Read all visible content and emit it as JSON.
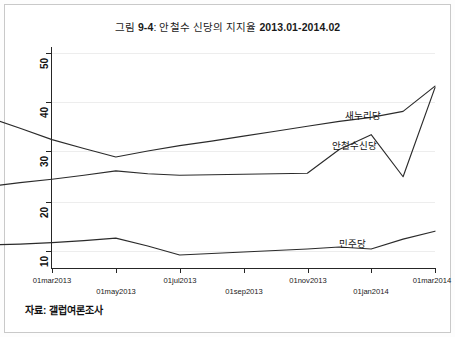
{
  "figure": {
    "title_prefix": "그림 ",
    "title_number": "9-4",
    "title_mid": ": 안철수 신당의 지지율 ",
    "title_range": "2013.01-2014.02",
    "title_full": "그림 9-4: 안철수 신당의 지지율 2013.01-2014.02",
    "source_note": "자료: 갤럽여론조사"
  },
  "chart_data": {
    "type": "line",
    "title": "그림 9-4: 안철수 신당의 지지율 2013.01-2014.02",
    "xlabel": "",
    "ylabel": "",
    "ylim": [
      5,
      52
    ],
    "xlim": [
      "01jan2013",
      "01mar2014"
    ],
    "grid": true,
    "legend": "inline-annotations",
    "yticks": [
      10,
      20,
      30,
      40,
      50
    ],
    "ytick_labels": [
      "10",
      "20",
      "30",
      "40",
      "50"
    ],
    "xticks": [
      "01mar2013",
      "01may2013",
      "01jul2013",
      "01sep2013",
      "01nov2013",
      "01jan2014",
      "01mar2014"
    ],
    "x": [
      "2013-01",
      "2013-02",
      "2013-03",
      "2013-04",
      "2013-05",
      "2013-06",
      "2013-07",
      "2013-08",
      "2013-09",
      "2013-10",
      "2013-11",
      "2013-12",
      "2014-01",
      "2014-02",
      "2014-03"
    ],
    "series": [
      {
        "name": "새누리당",
        "label": "새누리당",
        "color": "#2b2b2b",
        "values": [
          37.0,
          34.8,
          32.5,
          30.7,
          29.0,
          30.2,
          31.3,
          32.2,
          33.2,
          34.2,
          35.2,
          36.2,
          37.0,
          38.2,
          43.3
        ],
        "label_x": 345,
        "label_y": 108
      },
      {
        "name": "안철수신당",
        "label": "안철수신당",
        "color": "#2b2b2b",
        "values": [
          23.0,
          23.8,
          24.5,
          25.3,
          26.2,
          25.6,
          25.3,
          25.4,
          25.5,
          25.6,
          25.7,
          30.5,
          33.5,
          25.0,
          43.0
        ],
        "label_x": 332,
        "label_y": 138
      },
      {
        "name": "민주당",
        "label": "민주당",
        "color": "#2b2b2b",
        "values": [
          11.2,
          11.4,
          11.7,
          12.1,
          12.6,
          11.0,
          9.2,
          9.5,
          9.8,
          10.1,
          10.4,
          10.8,
          10.4,
          12.4,
          14.0
        ],
        "label_x": 339,
        "label_y": 236
      }
    ],
    "annotations": [
      {
        "text": "새누리당",
        "x": 345,
        "y": 108
      },
      {
        "text": "안철수신당",
        "x": 332,
        "y": 138
      },
      {
        "text": "민주당",
        "x": 339,
        "y": 236
      }
    ]
  }
}
